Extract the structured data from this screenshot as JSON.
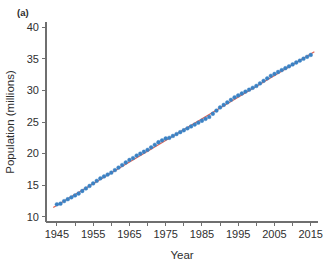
{
  "figure": {
    "panel_label": "(a)",
    "background_color": "#ffffff"
  },
  "chart_data": {
    "type": "scatter",
    "title": "",
    "subtitle": "",
    "xlabel": "Year",
    "ylabel": "Population (millions)",
    "xlim": [
      1942,
      2017
    ],
    "ylim": [
      9.2,
      40.8
    ],
    "grid": false,
    "legend_position": "none",
    "xticks": [
      1945,
      1955,
      1965,
      1975,
      1985,
      1995,
      2005,
      2015
    ],
    "xtick_labels": [
      "1945",
      "1955",
      "1965",
      "1975",
      "1985",
      "1995",
      "2005",
      "2015"
    ],
    "xminor_ticks": [
      1950,
      1960,
      1970,
      1980,
      1990,
      2000,
      2010
    ],
    "yticks": [
      10,
      15,
      20,
      25,
      30,
      35,
      40
    ],
    "ytick_labels": [
      "10",
      "15",
      "20",
      "25",
      "30",
      "35",
      "40"
    ],
    "colors": {
      "markers": "#3b82c4",
      "fit_line": "#e0604f",
      "axis": "#6f6f6f",
      "text": "#2f2f2f"
    },
    "series": [
      {
        "name": "Population",
        "type": "scatter",
        "marker": "circle",
        "color": "#3b82c4",
        "x": [
          1945,
          1946,
          1947,
          1948,
          1949,
          1950,
          1951,
          1952,
          1953,
          1954,
          1955,
          1956,
          1957,
          1958,
          1959,
          1960,
          1961,
          1962,
          1963,
          1964,
          1965,
          1966,
          1967,
          1968,
          1969,
          1970,
          1971,
          1972,
          1973,
          1974,
          1975,
          1976,
          1977,
          1978,
          1979,
          1980,
          1981,
          1982,
          1983,
          1984,
          1985,
          1986,
          1987,
          1988,
          1989,
          1990,
          1991,
          1992,
          1993,
          1994,
          1995,
          1996,
          1997,
          1998,
          1999,
          2000,
          2001,
          2002,
          2003,
          2004,
          2005,
          2006,
          2007,
          2008,
          2009,
          2010,
          2011,
          2012,
          2013,
          2014,
          2015
        ],
        "y": [
          12.0,
          12.1,
          12.5,
          12.8,
          13.1,
          13.4,
          13.7,
          14.1,
          14.5,
          14.9,
          15.3,
          15.7,
          16.1,
          16.4,
          16.7,
          17.0,
          17.4,
          17.8,
          18.2,
          18.6,
          19.0,
          19.3,
          19.7,
          20.0,
          20.3,
          20.6,
          21.0,
          21.4,
          21.8,
          22.1,
          22.4,
          22.5,
          22.8,
          23.1,
          23.4,
          23.7,
          24.0,
          24.3,
          24.6,
          24.9,
          25.2,
          25.5,
          25.8,
          26.3,
          26.8,
          27.3,
          27.7,
          28.1,
          28.5,
          28.9,
          29.2,
          29.5,
          29.8,
          30.1,
          30.4,
          30.7,
          31.1,
          31.5,
          31.9,
          32.3,
          32.6,
          32.9,
          33.2,
          33.5,
          33.8,
          34.1,
          34.4,
          34.7,
          35.0,
          35.3,
          35.6
        ]
      },
      {
        "name": "Linear fit",
        "type": "line",
        "color": "#e0604f",
        "x": [
          1944,
          2016
        ],
        "y": [
          11.5,
          36.1
        ]
      }
    ]
  }
}
